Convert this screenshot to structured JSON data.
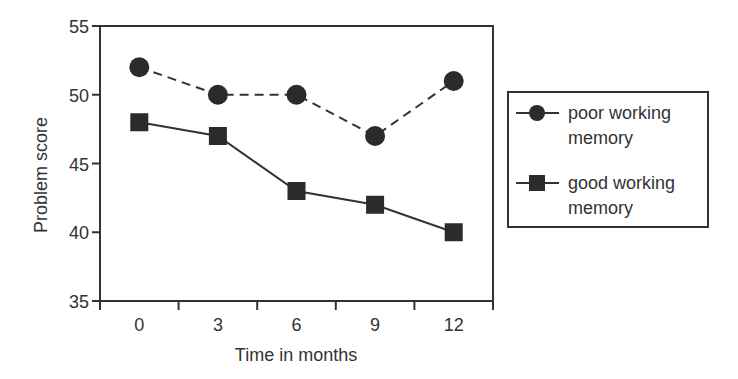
{
  "chart_data": {
    "type": "line",
    "title": "",
    "xlabel": "Time in months",
    "ylabel": "Problem score",
    "categories": [
      "0",
      "3",
      "6",
      "9",
      "12"
    ],
    "x": [
      0,
      3,
      6,
      9,
      12
    ],
    "ylim": [
      35,
      55
    ],
    "yticks": [
      35,
      40,
      45,
      50,
      55
    ],
    "grid": false,
    "legend_position": "right",
    "series": [
      {
        "name": "poor working memory",
        "legend_lines": [
          "poor working",
          "memory"
        ],
        "marker": "circle",
        "line_style": "dashed",
        "values": [
          52,
          50,
          50,
          47,
          51
        ]
      },
      {
        "name": "good working memory",
        "legend_lines": [
          "good working",
          "memory"
        ],
        "marker": "square",
        "line_style": "solid",
        "values": [
          48,
          47,
          43,
          42,
          40
        ]
      }
    ]
  },
  "colors": {
    "axis": "#333333",
    "marker": "#2b2b2b",
    "line": "#333333",
    "text": "#333333"
  }
}
